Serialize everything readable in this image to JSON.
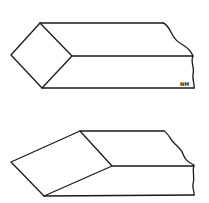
{
  "diagram": {
    "figures": [
      {
        "id": "square-end-tool-bit",
        "end_face": "diamond (square rotated 45°)",
        "vertices": {
          "top": [
            40,
            23
          ],
          "left": [
            11,
            55
          ],
          "right": [
            72,
            56
          ],
          "bottom": [
            42,
            88
          ]
        },
        "edges_to_break": {
          "top": [
            163,
            23
          ],
          "middle": [
            193,
            56
          ],
          "bottom": [
            194,
            88
          ]
        }
      },
      {
        "id": "angled-end-tool-bit",
        "end_face": "skewed parallelogram",
        "vertices": {
          "top": [
            80,
            131
          ],
          "left": [
            11,
            162
          ],
          "right": [
            112,
            166
          ],
          "bottom": [
            44,
            196
          ]
        },
        "edges_to_break": {
          "top": [
            164,
            131
          ],
          "middle": [
            194,
            166
          ],
          "bottom": [
            194,
            195
          ]
        }
      }
    ],
    "signature": "NM",
    "line_color": "#1a1a1a",
    "background": "#ffffff"
  }
}
